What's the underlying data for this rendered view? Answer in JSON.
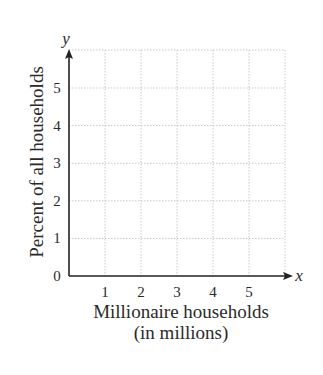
{
  "chart_data": {
    "type": "scatter",
    "title": "",
    "xlabel": "Millionaire households (in millions)",
    "xlabel_lines": [
      "Millionaire households",
      "(in millions)"
    ],
    "ylabel": "Percent of all households",
    "x_axis_variable": "x",
    "y_axis_variable": "y",
    "x_ticks": [
      "1",
      "2",
      "3",
      "4",
      "5"
    ],
    "y_ticks": [
      "0",
      "1",
      "2",
      "3",
      "4",
      "5"
    ],
    "xlim": [
      0,
      6
    ],
    "ylim": [
      0,
      6
    ],
    "grid": true,
    "grid_style": "dotted",
    "series": [],
    "legend": null,
    "colors": {
      "axis": "#222222",
      "grid": "#c8c8c8",
      "text": "#2a2a2a"
    }
  }
}
